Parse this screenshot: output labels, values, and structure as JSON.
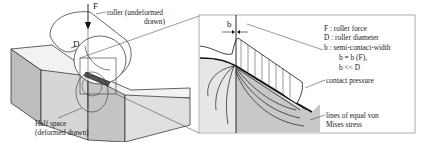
{
  "diagram": {
    "left": {
      "force_label": "F",
      "diameter_label": "D",
      "roller_label_line1": "roller (undeformed",
      "roller_label_line2": "drawn)",
      "halfspace_label_line1": "Half space",
      "halfspace_label_line2": "(deformed drawn)"
    },
    "detail": {
      "width_label": "b",
      "legend": [
        "F : roller force",
        "D : roller diameter",
        "b : semi-contact-width",
        "b = b (F),",
        "b << D"
      ],
      "contact_pressure_label": "contact pressure",
      "von_mises_line1": "lines of equal von",
      "von_mises_line2": "Mises stress"
    },
    "colors": {
      "line": "#1a1a1a",
      "block_side": "#bdbdbd",
      "block_front": "#d6d6d6",
      "stress_fill": "#c8c8c8",
      "frame": "#888888"
    }
  }
}
